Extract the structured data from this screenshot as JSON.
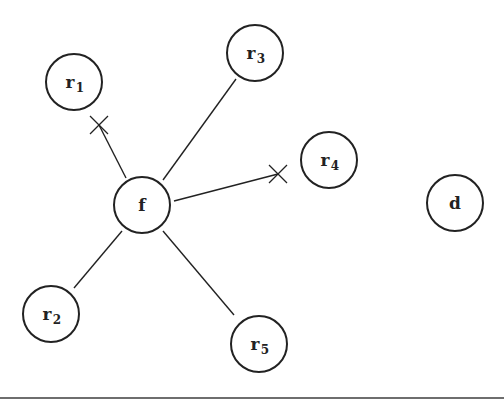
{
  "diagram": {
    "type": "network",
    "stroke_color": "#222222",
    "node_radius": 28,
    "nodes": [
      {
        "id": "f",
        "label": "f",
        "sub": "",
        "x": 142,
        "y": 205
      },
      {
        "id": "r1",
        "label": "r",
        "sub": "1",
        "x": 74,
        "y": 82
      },
      {
        "id": "r2",
        "label": "r",
        "sub": "2",
        "x": 51,
        "y": 314
      },
      {
        "id": "r3",
        "label": "r",
        "sub": "3",
        "x": 255,
        "y": 53
      },
      {
        "id": "r4",
        "label": "r",
        "sub": "4",
        "x": 329,
        "y": 160
      },
      {
        "id": "r5",
        "label": "r",
        "sub": "5",
        "x": 259,
        "y": 344
      },
      {
        "id": "d",
        "label": "d",
        "sub": "",
        "x": 455,
        "y": 203
      }
    ],
    "edges": [
      {
        "from": "f",
        "to": "r1",
        "blocked": true,
        "x1": 126,
        "y1": 178,
        "x2": 99,
        "y2": 125,
        "cross_x": 99,
        "cross_y": 125
      },
      {
        "from": "f",
        "to": "r3",
        "blocked": false,
        "x1": 163,
        "y1": 180,
        "x2": 236,
        "y2": 79
      },
      {
        "from": "f",
        "to": "r4",
        "blocked": true,
        "x1": 174,
        "y1": 201,
        "x2": 278,
        "y2": 174,
        "cross_x": 278,
        "cross_y": 174
      },
      {
        "from": "f",
        "to": "r2",
        "blocked": false,
        "x1": 122,
        "y1": 231,
        "x2": 74,
        "y2": 288
      },
      {
        "from": "f",
        "to": "r5",
        "blocked": false,
        "x1": 163,
        "y1": 231,
        "x2": 234,
        "y2": 315
      }
    ]
  }
}
